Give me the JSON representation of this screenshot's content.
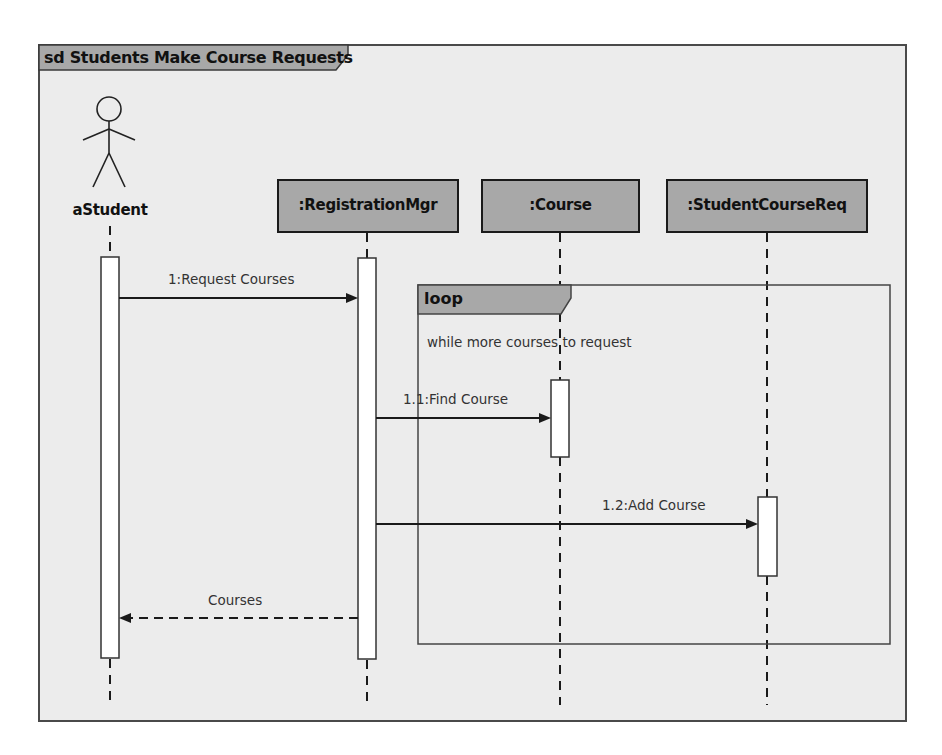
{
  "diagram": {
    "type": "UML sequence diagram",
    "frame_title": "sd Students Make Course Requests",
    "actor": {
      "name": "aStudent"
    },
    "lifelines": [
      {
        "name": ":RegistrationMgr"
      },
      {
        "name": ":Course"
      },
      {
        "name": ":StudentCourseReq"
      }
    ],
    "combined_fragment": {
      "operator": "loop",
      "guard": "while more courses to request"
    },
    "messages": [
      {
        "label": "1:Request Courses",
        "from": "aStudent",
        "to": ":RegistrationMgr",
        "kind": "synchronous"
      },
      {
        "label": "1.1:Find Course",
        "from": ":RegistrationMgr",
        "to": ":Course",
        "kind": "synchronous"
      },
      {
        "label": "1.2:Add Course",
        "from": ":RegistrationMgr",
        "to": ":StudentCourseReq",
        "kind": "synchronous"
      },
      {
        "label": "Courses",
        "from": ":RegistrationMgr",
        "to": "aStudent",
        "kind": "return"
      }
    ],
    "colors": {
      "frame_background": "#ececec",
      "object_fill": "#a8a8a8",
      "tab_fill": "#a8a8a8",
      "line": "#1a1a1a",
      "activation_fill": "#ffffff"
    }
  }
}
